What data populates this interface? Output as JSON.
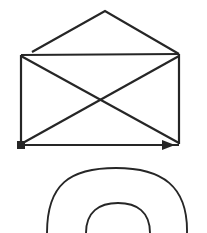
{
  "canvas": {
    "width": 207,
    "height": 233,
    "background_color": "#ffffff",
    "stroke_color": "#262626",
    "stroke_width": 2.2,
    "thin_stroke_width": 1.9
  },
  "figure": {
    "parts": [
      {
        "name": "envelope-flap",
        "type": "polyline",
        "points": "32,52 105,11 179,54"
      },
      {
        "name": "envelope-top-edge",
        "type": "line",
        "points": "21,55 179,54"
      },
      {
        "name": "envelope-left-edge",
        "type": "line",
        "points": "21,55 21,144"
      },
      {
        "name": "envelope-right-edge",
        "type": "line",
        "points": "179,54 179,144"
      },
      {
        "name": "envelope-bottom-edge",
        "type": "line",
        "points": "21,145 179,145"
      },
      {
        "name": "envelope-diagonal-down",
        "type": "line",
        "points": "21,56 179,143"
      },
      {
        "name": "envelope-diagonal-up",
        "type": "line",
        "points": "21,144 179,56"
      },
      {
        "name": "start-square-marker",
        "type": "square",
        "x": 17,
        "y": 141,
        "size": 8
      },
      {
        "name": "direction-arrowhead",
        "type": "triangle",
        "tip_x": 175,
        "tip_y": 145,
        "length": 13,
        "half_height": 5
      },
      {
        "name": "outer-arch-curve",
        "type": "arc",
        "path": "M 47,233 C 47,184 70,168 116,168 C 162,168 188,186 187,233"
      },
      {
        "name": "inner-arch-curve",
        "type": "arc",
        "path": "M 86,233 C 86,212 99,203 118,203 C 137,203 150,212 150,233"
      }
    ],
    "crossing_point": {
      "label": "diagonal-intersection",
      "x": 100,
      "y": 99
    }
  }
}
